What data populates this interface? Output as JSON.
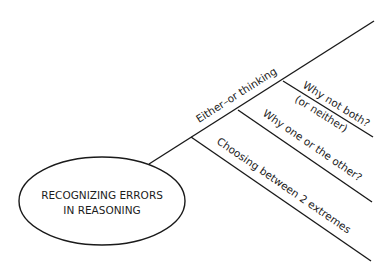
{
  "diagram": {
    "type": "mind-map",
    "central_topic": {
      "line1": "RECOGNIZING ERRORS",
      "line2": "IN REASONING"
    },
    "main_branch": {
      "label": "Either–or thinking",
      "sub_branches": [
        {
          "label_line1": "Why not both?",
          "label_line2": "(or neither)"
        },
        {
          "label": "Why one or the other?"
        },
        {
          "label": "Choosing between 2 extremes"
        }
      ]
    },
    "colors": {
      "ink": "#1a1a1a",
      "background": "#ffffff"
    }
  }
}
